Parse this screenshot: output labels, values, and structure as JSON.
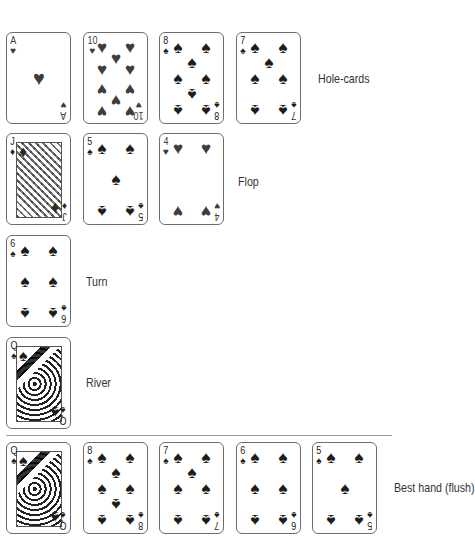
{
  "colors": {
    "spade": "#1c1c1c",
    "heart": "#3d3d3d",
    "card_border": "#6e6e6e",
    "label": "#333333",
    "divider": "#9a9a9a"
  },
  "suits": {
    "spades": "♠",
    "hearts": "♥",
    "diamonds": "♦"
  },
  "rows": [
    {
      "name": "hole-cards",
      "label": "Hole-cards",
      "cards": [
        {
          "rank": "A",
          "suit": "hearts"
        },
        {
          "rank": "10",
          "suit": "hearts"
        },
        {
          "rank": "8",
          "suit": "spades"
        },
        {
          "rank": "7",
          "suit": "spades"
        }
      ]
    },
    {
      "name": "flop",
      "label": "Flop",
      "cards": [
        {
          "rank": "J",
          "suit": "diamonds"
        },
        {
          "rank": "5",
          "suit": "spades"
        },
        {
          "rank": "4",
          "suit": "hearts"
        }
      ]
    },
    {
      "name": "turn",
      "label": "Turn",
      "cards": [
        {
          "rank": "6",
          "suit": "spades"
        }
      ]
    },
    {
      "name": "river",
      "label": "River",
      "cards": [
        {
          "rank": "Q",
          "suit": "spades"
        }
      ]
    },
    {
      "name": "best-hand",
      "label": "Best hand (flush)",
      "cards": [
        {
          "rank": "Q",
          "suit": "spades"
        },
        {
          "rank": "8",
          "suit": "spades"
        },
        {
          "rank": "7",
          "suit": "spades"
        },
        {
          "rank": "6",
          "suit": "spades"
        },
        {
          "rank": "5",
          "suit": "spades"
        }
      ]
    }
  ]
}
